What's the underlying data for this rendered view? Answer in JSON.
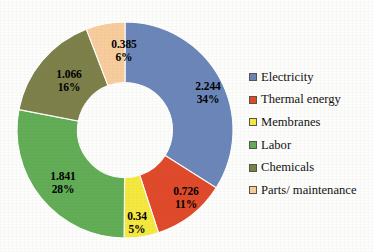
{
  "chart_data": {
    "type": "pie",
    "variant": "donut",
    "title": "",
    "subtitle": "",
    "xlabel": "",
    "ylabel": "",
    "grid": false,
    "legend_position": "right",
    "hole_ratio": 0.44,
    "start_angle_deg": 0,
    "direction": "clockwise",
    "background_color": "#ffffff",
    "label_text_color": "#000000",
    "categories": [
      "Electricity",
      "Thermal energy",
      "Membranes",
      "Labor",
      "Chemicals",
      "Parts/ maintenance"
    ],
    "values": [
      2.244,
      0.726,
      0.34,
      1.841,
      1.066,
      0.385
    ],
    "percentages": [
      34,
      11,
      5,
      28,
      16,
      6
    ],
    "colors": [
      "#6b86b8",
      "#e04a2b",
      "#f5e83f",
      "#62ad56",
      "#7d8049",
      "#f8cd9d"
    ],
    "slices": [
      {
        "label": "Electricity",
        "value": 2.244,
        "value_text": "2.244",
        "percent": 34,
        "percent_text": "34%",
        "color": "#6b86b8",
        "label_x": 196,
        "label_y": 84
      },
      {
        "label": "Thermal energy",
        "value": 0.726,
        "value_text": "0.726",
        "percent": 11,
        "percent_text": "11%",
        "color": "#e04a2b",
        "label_x": 174,
        "label_y": 189
      },
      {
        "label": "Membranes",
        "value": 0.34,
        "value_text": "0.34",
        "percent": 5,
        "percent_text": "5%",
        "color": "#f5e83f",
        "label_x": 125,
        "label_y": 214
      },
      {
        "label": "Labor",
        "value": 1.841,
        "value_text": "1.841",
        "percent": 28,
        "percent_text": "28%",
        "color": "#62ad56",
        "label_x": 51,
        "label_y": 174
      },
      {
        "label": "Chemicals",
        "value": 1.066,
        "value_text": "1.066",
        "percent": 16,
        "percent_text": "16%",
        "color": "#7d8049",
        "label_x": 57,
        "label_y": 72
      },
      {
        "label": "Parts/ maintenance",
        "value": 0.385,
        "value_text": "0.385",
        "percent": 6,
        "percent_text": "6%",
        "color": "#f8cd9d",
        "label_x": 112,
        "label_y": 42
      }
    ]
  },
  "legend": {
    "items": [
      {
        "label": "Electricity",
        "color": "#6b86b8"
      },
      {
        "label": "Thermal energy",
        "color": "#e04a2b"
      },
      {
        "label": "Membranes",
        "color": "#f5e83f"
      },
      {
        "label": "Labor",
        "color": "#62ad56"
      },
      {
        "label": "Chemicals",
        "color": "#7d8049"
      },
      {
        "label": "Parts/ maintenance",
        "color": "#f8cd9d"
      }
    ]
  }
}
